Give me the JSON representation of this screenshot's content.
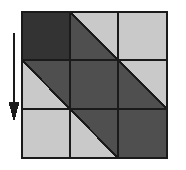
{
  "figure": {
    "type": "patchwork-block-diagram",
    "canvas": {
      "width": 186,
      "height": 170,
      "background": "#ffffff"
    },
    "palette": {
      "dark": "#333333",
      "medium": "#4f4f4f",
      "light": "#c9c9c9",
      "outline": "#1a1a1a",
      "arrow": "#1a1a1a"
    },
    "block": {
      "x": 22,
      "y": 12,
      "width": 145,
      "height": 146,
      "rows": 3,
      "columns": 3,
      "grid_lines_x": [
        22,
        70,
        118,
        167
      ],
      "grid_lines_y": [
        12,
        60,
        109,
        158
      ],
      "border_width": 2,
      "grid_line_width": 2
    },
    "cells": [
      {
        "id": "cell-r1c1",
        "row": 1,
        "column": 1,
        "patch": "solid",
        "shade": "dark",
        "color": "#333333"
      },
      {
        "id": "cell-r1c2",
        "row": 1,
        "column": 2,
        "patch": "half-square-triangle",
        "diagonal": "tl-br",
        "upper_right_shade": "light",
        "upper_right_color": "#c9c9c9",
        "lower_left_shade": "medium",
        "lower_left_color": "#4f4f4f"
      },
      {
        "id": "cell-r1c3",
        "row": 1,
        "column": 3,
        "patch": "solid",
        "shade": "light",
        "color": "#c9c9c9"
      },
      {
        "id": "cell-r2c1",
        "row": 2,
        "column": 1,
        "patch": "half-square-triangle",
        "diagonal": "tl-br",
        "upper_right_shade": "medium",
        "upper_right_color": "#4f4f4f",
        "lower_left_shade": "light",
        "lower_left_color": "#c9c9c9"
      },
      {
        "id": "cell-r2c2",
        "row": 2,
        "column": 2,
        "patch": "solid",
        "shade": "medium",
        "color": "#4f4f4f"
      },
      {
        "id": "cell-r2c3",
        "row": 2,
        "column": 3,
        "patch": "half-square-triangle",
        "diagonal": "tl-br",
        "upper_right_shade": "light",
        "upper_right_color": "#c9c9c9",
        "lower_left_shade": "medium",
        "lower_left_color": "#4f4f4f"
      },
      {
        "id": "cell-r3c1",
        "row": 3,
        "column": 1,
        "patch": "solid",
        "shade": "light",
        "color": "#c9c9c9"
      },
      {
        "id": "cell-r3c2",
        "row": 3,
        "column": 2,
        "patch": "half-square-triangle",
        "diagonal": "tl-br",
        "upper_right_shade": "medium",
        "upper_right_color": "#4f4f4f",
        "lower_left_shade": "light",
        "lower_left_color": "#c9c9c9"
      },
      {
        "id": "cell-r3c3",
        "row": 3,
        "column": 3,
        "patch": "solid",
        "shade": "medium",
        "color": "#4f4f4f"
      }
    ],
    "arrow": {
      "direction": "down",
      "x": 14,
      "y_start": 33,
      "y_end": 122,
      "shaft_width": 2,
      "head_width": 11,
      "head_length": 20,
      "color": "#1a1a1a",
      "label": ""
    }
  }
}
